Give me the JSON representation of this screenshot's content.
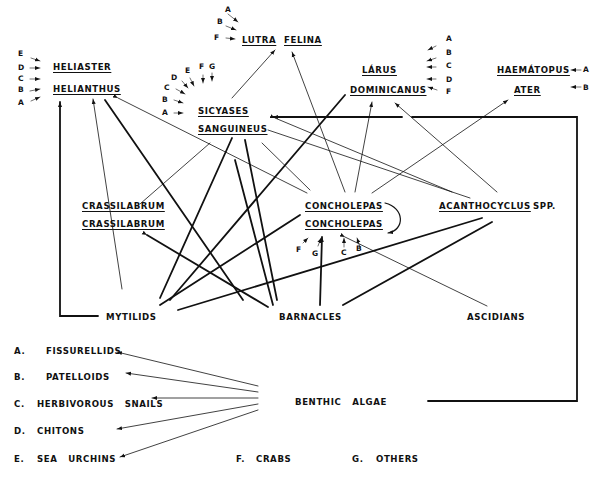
{
  "diagram": {
    "type": "food-web",
    "predators": {
      "heliaster": {
        "line1": "HELIASTER",
        "line2": "HELIANTHUS",
        "prey_letters": [
          "E",
          "D",
          "C",
          "B",
          "A"
        ]
      },
      "lutra": {
        "line1": "LUTRA",
        "line2": "FELINA",
        "prey_letters": [
          "A",
          "B",
          "F"
        ]
      },
      "sicyases": {
        "line1": "SICYASES",
        "line2": "SANGUINEUS",
        "prey_letters": [
          "A",
          "B",
          "C",
          "D",
          "E",
          "F",
          "G"
        ]
      },
      "larus": {
        "line1": "LÁRUS",
        "line2": "DOMINICANUS",
        "prey_letters": [
          "A",
          "B",
          "C",
          "D",
          "F"
        ]
      },
      "haematopus": {
        "line1": "HAEMÁTOPUS",
        "line2": "ATER",
        "prey_letters": [
          "A",
          "B"
        ]
      },
      "crassilabrum": {
        "line1": "CRASSILABRUM",
        "line2": "CRASSILABRUM"
      },
      "concholepas": {
        "line1": "CONCHOLEPAS",
        "line2": "CONCHOLEPAS",
        "prey_letters": [
          "F",
          "G",
          "C",
          "B"
        ]
      },
      "acanthocyclus": {
        "line1": "ACANTHOCYCLUS",
        "suffix": "SPP."
      }
    },
    "prey": {
      "mytilids": "MYTILIDS",
      "barnacles": "BARNACLES",
      "ascidians": "ASCIDIANS",
      "benthic_algae": "BENTHIC   ALGAE"
    },
    "legend": [
      {
        "key": "A.",
        "label": "FISSURELLIDS"
      },
      {
        "key": "B.",
        "label": "PATELLOIDS"
      },
      {
        "key": "C.",
        "label": "HERBIVOROUS   SNAILS"
      },
      {
        "key": "D.",
        "label": "CHITONS"
      },
      {
        "key": "E.",
        "label": "SEA   URCHINS"
      },
      {
        "key": "F.",
        "label": "CRABS"
      },
      {
        "key": "G.",
        "label": "OTHERS"
      }
    ],
    "line_color": "#111111"
  }
}
